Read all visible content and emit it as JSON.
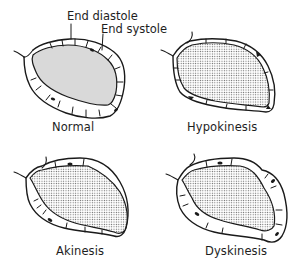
{
  "figure": {
    "callouts": {
      "end_diastole": "End diastole",
      "end_systole": "End systole"
    },
    "panels": [
      {
        "id": "normal",
        "label": "Normal"
      },
      {
        "id": "hypokinesis",
        "label": "Hypokinesis"
      },
      {
        "id": "akinesis",
        "label": "Akinesis"
      },
      {
        "id": "dyskinesis",
        "label": "Dyskinesis"
      }
    ],
    "legend": {
      "outer_outline": "End diastole",
      "stippled_cavity": "End systole"
    },
    "colors": {
      "ink": "#1a1a1a",
      "stipple": "#6e6e6e",
      "background": "#ffffff"
    }
  }
}
